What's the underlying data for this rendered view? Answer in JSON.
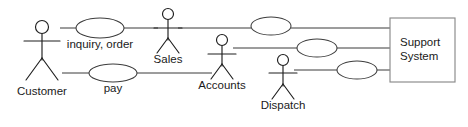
{
  "diagram": {
    "type": "uml-use-case-diagram",
    "title": "",
    "background_color": "#ffffff",
    "line_color": "#3a3a3a",
    "text_color": "#1a1a1a",
    "box_border_color": "#8a8a8a",
    "actors": [
      {
        "id": "customer",
        "label": "Customer",
        "x": 42,
        "head_y": 27,
        "label_x": 42,
        "label_y": 95
      },
      {
        "id": "sales",
        "label": "Sales",
        "x": 168,
        "head_y": 14,
        "label_x": 168,
        "label_y": 62
      },
      {
        "id": "accounts",
        "label": "Accounts",
        "x": 222,
        "head_y": 40,
        "label_x": 222,
        "label_y": 88
      },
      {
        "id": "dispatch",
        "label": "Dispatch",
        "x": 283,
        "head_y": 60,
        "label_x": 283,
        "label_y": 108
      }
    ],
    "use_cases": [
      {
        "id": "inquiry-order",
        "label": "inquiry, order",
        "cx": 100,
        "cy": 28,
        "rx": 24,
        "ry": 10,
        "label_x": 100,
        "label_y": 48
      },
      {
        "id": "pay",
        "label": "pay",
        "cx": 113,
        "cy": 73,
        "rx": 24,
        "ry": 9,
        "label_x": 113,
        "label_y": 92
      },
      {
        "id": "usecase-unlabeled-1",
        "label": "",
        "cx": 271,
        "cy": 26,
        "rx": 20,
        "ry": 9,
        "label_x": 271,
        "label_y": 0
      },
      {
        "id": "usecase-unlabeled-2",
        "label": "",
        "cx": 317,
        "cy": 48,
        "rx": 20,
        "ry": 9,
        "label_x": 317,
        "label_y": 0
      },
      {
        "id": "usecase-unlabeled-3",
        "label": "",
        "cx": 357,
        "cy": 70,
        "rx": 20,
        "ry": 9,
        "label_x": 357,
        "label_y": 0
      }
    ],
    "system": {
      "id": "support-system",
      "label_line1": "Support",
      "label_line2": "System",
      "x": 390,
      "y": 18,
      "width": 65,
      "height": 64,
      "text_x": 400,
      "text_line1_y": 46,
      "text_line2_y": 60
    },
    "associations": [
      {
        "id": "assoc-row-top",
        "y": 28,
        "x1": 60,
        "x2": 390
      },
      {
        "id": "assoc-row-middle",
        "y": 48,
        "x1": 235,
        "x2": 390
      },
      {
        "id": "assoc-row-pay",
        "y": 73,
        "x1": 62,
        "x2": 210
      },
      {
        "id": "assoc-row-bottom",
        "y": 70,
        "x1": 296,
        "x2": 390
      }
    ]
  }
}
